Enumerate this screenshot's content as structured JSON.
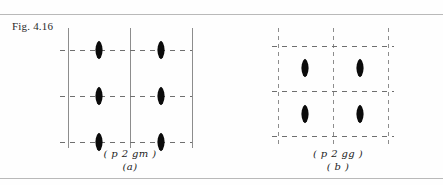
{
  "figure": {
    "label": "Fig. 4.16"
  },
  "panels": [
    {
      "id": "a",
      "symbol_caption": "( p 2 gm )",
      "index_caption": "(a)",
      "vertical_lines": [
        {
          "x": 8,
          "style": "solid"
        },
        {
          "x": 70,
          "style": "solid"
        },
        {
          "x": 132,
          "style": "solid"
        }
      ],
      "horizontal_lines": [
        {
          "y": 22,
          "style": "dashed"
        },
        {
          "y": 68,
          "style": "dashed"
        },
        {
          "y": 114,
          "style": "dashed"
        }
      ],
      "symbols": [
        {
          "type": "two-fold-axis",
          "x": 39,
          "y": 22
        },
        {
          "type": "two-fold-axis",
          "x": 101,
          "y": 22
        },
        {
          "type": "two-fold-axis",
          "x": 39,
          "y": 68
        },
        {
          "type": "two-fold-axis",
          "x": 101,
          "y": 68
        },
        {
          "type": "two-fold-axis",
          "x": 39,
          "y": 114
        },
        {
          "type": "two-fold-axis",
          "x": 101,
          "y": 114
        }
      ]
    },
    {
      "id": "b",
      "symbol_caption": "( p 2 gg )",
      "index_caption": "( b )",
      "vertical_lines": [
        {
          "x": 10,
          "style": "dashed"
        },
        {
          "x": 65,
          "style": "dashed"
        },
        {
          "x": 120,
          "style": "dashed"
        }
      ],
      "horizontal_lines": [
        {
          "y": 18,
          "style": "dashed"
        },
        {
          "y": 63,
          "style": "dashed"
        },
        {
          "y": 108,
          "style": "dashed"
        }
      ],
      "symbols": [
        {
          "type": "two-fold-axis",
          "x": 37,
          "y": 40
        },
        {
          "type": "two-fold-axis",
          "x": 92,
          "y": 40
        },
        {
          "type": "two-fold-axis",
          "x": 37,
          "y": 86
        },
        {
          "type": "two-fold-axis",
          "x": 92,
          "y": 86
        }
      ]
    }
  ],
  "rules": {
    "top_label": "top-rule",
    "bottom_label": "bottom-rule"
  },
  "colors": {
    "ink": "#0b0b0b",
    "grid": "#8d8d8d",
    "rule": "#b9b9b9",
    "page": "#fefefe"
  }
}
